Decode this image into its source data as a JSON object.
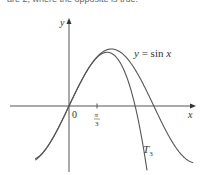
{
  "caption": "are 2, where the opposite is true.",
  "chart_data": {
    "type": "line",
    "title": "",
    "xlabel": "x",
    "ylabel": "y",
    "origin_label": "0",
    "tick_labels": [
      {
        "x": "π/3",
        "numerator": "π",
        "denominator": "3"
      }
    ],
    "grid": false,
    "series": [
      {
        "name": "y = sin x",
        "function": "sin(x)",
        "label": "y = sin x"
      },
      {
        "name": "T3",
        "function": "x - x^3/6",
        "label": "T3"
      }
    ],
    "xlim": [
      -1.3,
      3.6
    ],
    "ylim": [
      -1.2,
      1.6
    ]
  }
}
